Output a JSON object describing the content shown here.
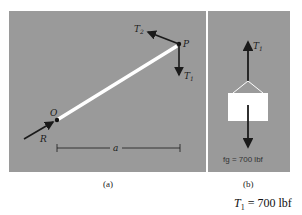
{
  "figure": {
    "panel_a": {
      "caption": "(a)",
      "labels": {
        "point_top": "P",
        "point_bottom": "O",
        "tension_2": "T2",
        "tension_1": "T1",
        "reaction": "R",
        "distance": "a"
      }
    },
    "panel_b": {
      "caption": "(b)",
      "labels": {
        "tension_1": "T1",
        "weight": "fg = 700 lbf"
      }
    },
    "result": {
      "symbol": "T",
      "subscript": "1",
      "value": "= 700 lbf"
    }
  },
  "colors": {
    "background": "#9a9a9a",
    "beam": "#ffffff",
    "arrow": "#1a1a1a"
  }
}
